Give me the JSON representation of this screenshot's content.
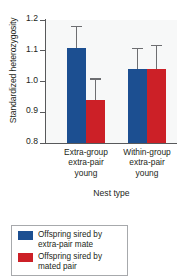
{
  "chart_data": {
    "type": "bar",
    "title": "",
    "subtitle": "",
    "xlabel": "Nest type",
    "ylabel": "Standardized heterozygosity",
    "ylim": [
      0.8,
      1.2
    ],
    "yticks": [
      "1.2",
      "1.1",
      "1.0",
      "0.9",
      "0.8"
    ],
    "ytick_values": [
      1.2,
      1.1,
      1.0,
      0.9,
      0.8
    ],
    "grid": false,
    "legend_position": "below-plot",
    "categories": [
      "Extra-group extra-pair young",
      "Within-group extra-pair young"
    ],
    "category_lines": [
      [
        "Extra-group",
        "extra-pair",
        "young"
      ],
      [
        "Within-group",
        "extra-pair",
        "young"
      ]
    ],
    "series": [
      {
        "name": "Offspring sired by extra-pair mate",
        "color": "#1c4f91",
        "values": [
          1.11,
          1.04
        ],
        "errors": [
          0.07,
          0.07
        ]
      },
      {
        "name": "Offspring sired by mated pair",
        "color": "#cc2027",
        "values": [
          0.94,
          1.04
        ],
        "errors": [
          0.07,
          0.08
        ]
      }
    ]
  },
  "legend": {
    "items": [
      {
        "label_line1": "Offspring sired by",
        "label_line2": "extra-pair mate",
        "color": "#1c4f91"
      },
      {
        "label_line1": "Offspring sired by",
        "label_line2": "mated pair",
        "color": "#cc2027"
      }
    ]
  },
  "axes": {
    "y_title": "Standardized heterozygosity",
    "x_title": "Nest type",
    "ticks": [
      {
        "label": "1.2"
      },
      {
        "label": "1.1"
      },
      {
        "label": "1.0"
      },
      {
        "label": "0.9"
      },
      {
        "label": "0.8"
      }
    ]
  },
  "groups": [
    {
      "line1": "Extra-group",
      "line2": "extra-pair",
      "line3": "young"
    },
    {
      "line1": "Within-group",
      "line2": "extra-pair",
      "line3": "young"
    }
  ]
}
